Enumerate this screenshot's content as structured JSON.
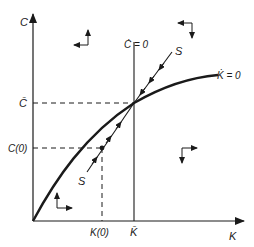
{
  "diagram": {
    "type": "phase-diagram",
    "axes": {
      "y_label": "C",
      "x_label": "K"
    },
    "steady_state": {
      "c_bar_label": "C̄",
      "k_bar_label": "K̄"
    },
    "initial": {
      "c0_label": "C(0)",
      "k0_label": "K(0)"
    },
    "loci": {
      "c_dot_zero": "Ċ = 0",
      "k_dot_zero": "K̇ = 0"
    },
    "saddle_path": {
      "label_upper": "S",
      "label_lower": "S"
    },
    "direction_arrows": [
      {
        "region": "upper-left",
        "horizontal": "left",
        "vertical": "up"
      },
      {
        "region": "upper-right",
        "horizontal": "left",
        "vertical": "down"
      },
      {
        "region": "lower-right",
        "horizontal": "right",
        "vertical": "down"
      },
      {
        "region": "lower-left",
        "horizontal": "right",
        "vertical": "up"
      }
    ]
  }
}
